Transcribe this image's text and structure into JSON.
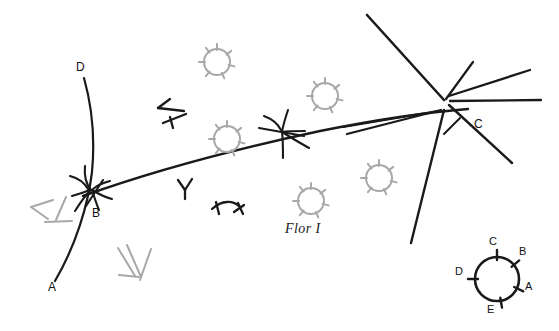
{
  "figure": {
    "kind": "hand-drawn-archaeological-plan",
    "background_color": "#ffffff",
    "ink_color": "#1a1a1a",
    "faint_ink_color": "#a8a8a8",
    "width": 559,
    "height": 331,
    "caption": "Flor I"
  },
  "main_labels": [
    {
      "id": "label-D",
      "text": "D",
      "x": 76,
      "y": 67
    },
    {
      "id": "label-B",
      "text": "B",
      "x": 92,
      "y": 213
    },
    {
      "id": "label-A",
      "text": "A",
      "x": 48,
      "y": 287
    },
    {
      "id": "label-C",
      "text": "C",
      "x": 474,
      "y": 124
    }
  ],
  "compass": {
    "name": "orientation-rose",
    "center_x": 497,
    "center_y": 279,
    "radius": 22,
    "ticks": [
      {
        "label": "C",
        "angle_deg": -90,
        "label_x": 489,
        "label_y": 242
      },
      {
        "label": "B",
        "angle_deg": -40,
        "label_x": 519,
        "label_y": 252
      },
      {
        "label": "A",
        "angle_deg": 25,
        "label_x": 525,
        "label_y": 287
      },
      {
        "label": "E",
        "angle_deg": 80,
        "label_x": 487,
        "label_y": 310
      },
      {
        "label": "D",
        "angle_deg": 180,
        "label_x": 455,
        "label_y": 272
      }
    ]
  },
  "symbols": {
    "ring_marks": [
      {
        "cx": 217,
        "cy": 62,
        "r": 13
      },
      {
        "cx": 227,
        "cy": 139,
        "r": 13
      },
      {
        "cx": 325,
        "cy": 96,
        "r": 13
      },
      {
        "cx": 311,
        "cy": 201,
        "r": 13
      },
      {
        "cx": 379,
        "cy": 178,
        "r": 13
      }
    ],
    "tent_marks": [
      {
        "x": 30,
        "y": 205,
        "rot": 0
      },
      {
        "x": 118,
        "y": 248,
        "rot": 12
      }
    ],
    "bird_marks": [
      {
        "x": 155,
        "y": 105,
        "rot": 0
      },
      {
        "x": 178,
        "y": 180,
        "rot": 0
      },
      {
        "x": 212,
        "y": 202,
        "rot": 0
      }
    ]
  },
  "legend_note": {
    "caption_x": 285,
    "caption_y": 221
  }
}
